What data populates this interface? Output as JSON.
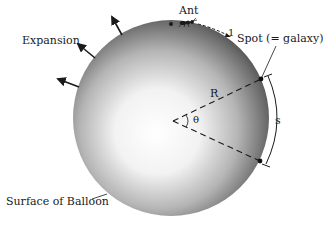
{
  "diagram": {
    "labels": {
      "expansion": "Expansion",
      "ant": "Ant",
      "ant_step": "1",
      "spot": "Spot (= galaxy)",
      "radius": "R",
      "angle": "θ",
      "arc_length": "s",
      "surface": "Surface of Balloon"
    },
    "balloon": {
      "cx": 171,
      "cy": 118,
      "r": 98,
      "highlight_color": "#ffffff",
      "edge_color": "#3a3a3a"
    },
    "angle_vertex": {
      "x": 173,
      "y": 121
    },
    "spots": [
      {
        "x": 261,
        "y": 79
      },
      {
        "x": 260,
        "y": 161
      }
    ],
    "ant_dot": {
      "x": 171,
      "y": 24
    },
    "expansion_arrows": 3,
    "colors": {
      "ink": "#1a1a1a",
      "background": "#ffffff"
    }
  }
}
